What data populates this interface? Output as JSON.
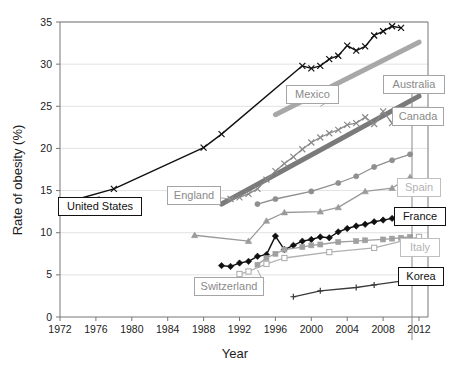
{
  "chart_data": {
    "type": "line",
    "title": "",
    "xlabel": "Year",
    "ylabel": "Rate of obesity (%)",
    "xlim": [
      1972,
      2013
    ],
    "ylim": [
      0,
      35
    ],
    "xticks": [
      1972,
      1976,
      1980,
      1984,
      1988,
      1992,
      1996,
      2000,
      2004,
      2008,
      2012
    ],
    "yticks": [
      0,
      5,
      10,
      15,
      20,
      25,
      30,
      35
    ],
    "grid": "horizontal",
    "legend": "inline-callout-labels",
    "series": [
      {
        "name": "United States",
        "color": "#101010",
        "marker": "x",
        "width": 1.4,
        "label_box": "black",
        "points": [
          [
            1973,
            13.7
          ],
          [
            1978,
            15.2
          ],
          [
            1988,
            20.1
          ],
          [
            1990,
            21.7
          ],
          [
            1999,
            29.8
          ],
          [
            2000,
            29.5
          ],
          [
            2001,
            29.8
          ],
          [
            2002,
            30.6
          ],
          [
            2003,
            31.0
          ],
          [
            2004,
            32.2
          ],
          [
            2005,
            31.6
          ],
          [
            2006,
            32.1
          ],
          [
            2007,
            33.4
          ],
          [
            2008,
            33.9
          ],
          [
            2009,
            34.5
          ],
          [
            2010,
            34.3
          ]
        ]
      },
      {
        "name": "Mexico",
        "color": "#a8a8a8",
        "marker": "none",
        "width": 5,
        "label_box": "gray",
        "points": [
          [
            1996,
            24.0
          ],
          [
            2012,
            32.6
          ]
        ]
      },
      {
        "name": "Australia",
        "color": "#7a7a7a",
        "marker": "none",
        "width": 5,
        "label_box": "gray",
        "points": [
          [
            1990,
            13.4
          ],
          [
            2012,
            26.2
          ]
        ]
      },
      {
        "name": "England",
        "color": "#8a8a8a",
        "marker": "x",
        "width": 1.3,
        "label_box": "gray",
        "points": [
          [
            1991,
            14.0
          ],
          [
            1992,
            14.2
          ],
          [
            1993,
            14.6
          ],
          [
            1994,
            15.2
          ],
          [
            1995,
            16.3
          ],
          [
            1996,
            17.3
          ],
          [
            1997,
            18.2
          ],
          [
            1998,
            19.0
          ],
          [
            1999,
            19.9
          ],
          [
            2000,
            20.7
          ],
          [
            2001,
            21.3
          ],
          [
            2002,
            21.8
          ],
          [
            2003,
            22.2
          ],
          [
            2004,
            22.8
          ],
          [
            2005,
            23.0
          ],
          [
            2006,
            23.7
          ],
          [
            2007,
            22.9
          ],
          [
            2008,
            24.4
          ],
          [
            2009,
            23.0
          ],
          [
            2010,
            23.1
          ]
        ]
      },
      {
        "name": "Canada",
        "color": "#8f8f8f",
        "marker": "circle",
        "width": 1.3,
        "label_box": "gray",
        "points": [
          [
            1994,
            13.4
          ],
          [
            1996,
            14.0
          ],
          [
            2000,
            14.9
          ],
          [
            2003,
            15.9
          ],
          [
            2005,
            16.7
          ],
          [
            2007,
            17.8
          ],
          [
            2009,
            18.6
          ],
          [
            2011,
            19.3
          ]
        ]
      },
      {
        "name": "Spain",
        "color": "#9a9a9a",
        "marker": "triangle",
        "width": 1.3,
        "label_box": "lightgray",
        "points": [
          [
            1987,
            9.7
          ],
          [
            1993,
            9.0
          ],
          [
            1995,
            11.4
          ],
          [
            1997,
            12.4
          ],
          [
            2001,
            12.5
          ],
          [
            2003,
            13.0
          ],
          [
            2006,
            14.9
          ],
          [
            2009,
            15.3
          ],
          [
            2011,
            16.6
          ]
        ]
      },
      {
        "name": "France",
        "color": "#101010",
        "marker": "diamond",
        "width": 1.4,
        "label_box": "black",
        "points": [
          [
            1990,
            6.1
          ],
          [
            1991,
            6.0
          ],
          [
            1992,
            6.4
          ],
          [
            1993,
            6.6
          ],
          [
            1994,
            7.2
          ],
          [
            1995,
            7.4
          ],
          [
            1996,
            9.6
          ],
          [
            1997,
            8.0
          ],
          [
            1998,
            8.5
          ],
          [
            1999,
            9.0
          ],
          [
            2000,
            9.2
          ],
          [
            2001,
            9.5
          ],
          [
            2002,
            9.4
          ],
          [
            2003,
            10.1
          ],
          [
            2004,
            10.5
          ],
          [
            2005,
            10.8
          ],
          [
            2006,
            11.0
          ],
          [
            2007,
            11.3
          ],
          [
            2008,
            11.5
          ],
          [
            2009,
            11.7
          ],
          [
            2010,
            12.1
          ]
        ]
      },
      {
        "name": "Italy",
        "color": "#a0a0a0",
        "marker": "square",
        "width": 1.3,
        "label_box": "lightgray",
        "points": [
          [
            1994,
            6.2
          ],
          [
            1995,
            7.0
          ],
          [
            1996,
            7.5
          ],
          [
            1997,
            8.0
          ],
          [
            1999,
            8.3
          ],
          [
            2000,
            8.5
          ],
          [
            2001,
            8.6
          ],
          [
            2003,
            8.9
          ],
          [
            2005,
            9.0
          ],
          [
            2006,
            9.1
          ],
          [
            2008,
            9.2
          ],
          [
            2009,
            9.3
          ],
          [
            2010,
            9.4
          ],
          [
            2011,
            9.5
          ]
        ]
      },
      {
        "name": "Switzerland",
        "color": "#b0b0b0",
        "marker": "open-square",
        "width": 1.3,
        "label_box": "gray",
        "points": [
          [
            1992,
            5.1
          ],
          [
            1993,
            5.4
          ],
          [
            1995,
            6.3
          ],
          [
            1997,
            7.0
          ],
          [
            2002,
            7.7
          ],
          [
            2007,
            8.2
          ],
          [
            2012,
            9.5
          ]
        ]
      },
      {
        "name": "Korea",
        "color": "#3a3a3a",
        "marker": "plus",
        "width": 1.3,
        "label_box": "black",
        "points": [
          [
            1998,
            2.4
          ],
          [
            2001,
            3.1
          ],
          [
            2005,
            3.5
          ],
          [
            2007,
            3.8
          ],
          [
            2011,
            4.4
          ]
        ]
      }
    ],
    "callouts": [
      {
        "label": "United States",
        "style": "black"
      },
      {
        "label": "Mexico",
        "style": "gray"
      },
      {
        "label": "Australia",
        "style": "gray"
      },
      {
        "label": "England",
        "style": "gray"
      },
      {
        "label": "Canada",
        "style": "gray"
      },
      {
        "label": "Spain",
        "style": "lightgray"
      },
      {
        "label": "France",
        "style": "black"
      },
      {
        "label": "Italy",
        "style": "lightgray"
      },
      {
        "label": "Switzerland",
        "style": "gray"
      },
      {
        "label": "Korea",
        "style": "black"
      }
    ]
  },
  "axes": {
    "y_title": "Rate of obesity (%)",
    "x_title": "Year",
    "y_ticks": [
      "0",
      "5",
      "10",
      "15",
      "20",
      "25",
      "30",
      "35"
    ],
    "x_ticks": [
      "1972",
      "1976",
      "1980",
      "1984",
      "1988",
      "1992",
      "1996",
      "2000",
      "2004",
      "2008",
      "2012"
    ]
  },
  "labels": {
    "united_states": "United States",
    "mexico": "Mexico",
    "australia": "Australia",
    "england": "England",
    "canada": "Canada",
    "spain": "Spain",
    "france": "France",
    "italy": "Italy",
    "switzerland": "Switzerland",
    "korea": "Korea"
  },
  "colors": {
    "plot_border": "#777777",
    "gridline": "#e2e2e2",
    "text": "#1c1c1c",
    "black_series": "#101010",
    "gray_series": "#8a8a8a",
    "light_series": "#b0b0b0"
  }
}
